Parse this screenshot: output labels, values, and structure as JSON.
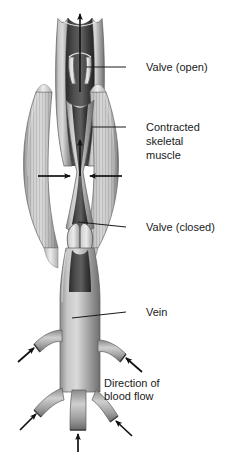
{
  "figure": {
    "background_color": "#ffffff"
  },
  "labels": [
    {
      "id": "valve-open",
      "text": "Valve (open)",
      "text_x": 146,
      "text_y": 71,
      "leader_x1": 126,
      "leader_y1": 67,
      "leader_x2": 86,
      "leader_y2": 67
    },
    {
      "id": "contracted-skeletal-muscle",
      "line1": "Contracted",
      "line2": "skeletal",
      "line3": "muscle",
      "text_x": 146,
      "text_y": 131,
      "line_height": 14,
      "leader_x1": 126,
      "leader_y1": 127,
      "leader_x2": 92,
      "leader_y2": 127
    },
    {
      "id": "valve-closed",
      "text": "Valve (closed)",
      "text_x": 146,
      "text_y": 231,
      "leader_x1": 126,
      "leader_y1": 227,
      "leader_x2": 78,
      "leader_y2": 222
    },
    {
      "id": "vein",
      "text": "Vein",
      "text_x": 146,
      "text_y": 316,
      "leader_x1": 126,
      "leader_y1": 312,
      "leader_x2": 72,
      "leader_y2": 318
    },
    {
      "id": "direction-of-blood-flow",
      "line1": "Direction of",
      "line2": "blood flow",
      "text_x": 104,
      "text_y": 387,
      "line_height": 13
    }
  ],
  "colors": {
    "vein_wall_light": "#cfcfcf",
    "vein_wall_mid": "#9a9a9a",
    "vein_wall_dark": "#5a5a5a",
    "lumen_dark": "#3a3a3a",
    "lumen_darkest": "#2a2a2a",
    "muscle_light": "#d2d2d2",
    "muscle_mid": "#a8a8a8",
    "muscle_dark": "#6e6e6e",
    "outline": "#4a4a4a",
    "arrow": "#111111",
    "text": "#1a1a1a",
    "tendon": "#e3e3e3"
  },
  "anatomy": {
    "upper_vein_label": "upper vein segment with open valve",
    "valve_open_state": "open",
    "valve_closed_state": "closed",
    "muscle_count": 2,
    "muscle_striations": true,
    "compression_arrow_count": 2,
    "compression_arrow_direction": "inward",
    "upward_flow_arrow_count": 2,
    "upward_flow_arrow_direction": "up",
    "tributary_upper_count": 2,
    "tributary_lower_count": 3,
    "inflow_arrow_count": 5
  }
}
